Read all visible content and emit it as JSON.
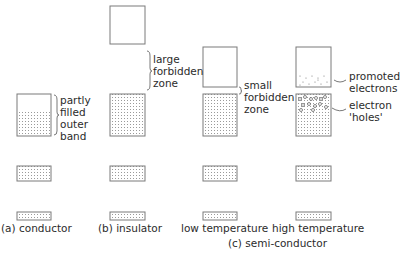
{
  "diagram": {
    "colors": {
      "outline": "#7a7a7a",
      "dot": "#9a9a9a",
      "text": "#2b2b2b"
    },
    "annotations": {
      "partly_filled": [
        "partly",
        "filled",
        "outer",
        "band"
      ],
      "large_forbidden": [
        "large",
        "forbidden",
        "zone"
      ],
      "small_forbidden": [
        "small",
        "forbidden",
        "zone"
      ],
      "promoted": [
        "promoted",
        "electrons"
      ],
      "holes": [
        "electron",
        "'holes'"
      ]
    },
    "captions": {
      "conductor": "(a) conductor",
      "insulator": "(b) insulator",
      "low_temp": "low temperature",
      "high_temp": "high temperature",
      "semiconductor": "(c) semi-conductor"
    },
    "columns": [
      {
        "id": "conductor",
        "bands": [
          "partly-filled-outer",
          "filled",
          "filled"
        ]
      },
      {
        "id": "insulator",
        "bands": [
          "empty-conduction",
          "filled",
          "filled",
          "filled"
        ]
      },
      {
        "id": "low-temperature",
        "bands": [
          "empty-conduction",
          "filled",
          "filled",
          "filled"
        ]
      },
      {
        "id": "high-temperature",
        "bands": [
          "promoted-electrons",
          "filled-with-holes",
          "filled",
          "filled"
        ]
      }
    ]
  }
}
